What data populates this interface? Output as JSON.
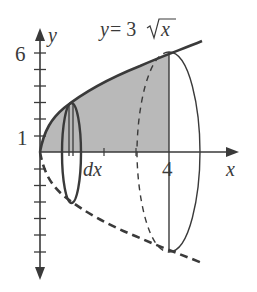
{
  "diagram": {
    "type": "solid-of-revolution",
    "curve_label_lhs": "y",
    "curve_label_eq": " = 3",
    "curve_label_var": "x",
    "axes": {
      "x_label": "x",
      "y_label": "y"
    },
    "ticks": {
      "y_label_top": "6",
      "y_label_bottom": "1",
      "x_label_right": "4"
    },
    "slice_label": "dx",
    "colors": {
      "stroke": "#3a3a3a",
      "shade": "#b9b9b9",
      "background": "#ffffff"
    }
  }
}
